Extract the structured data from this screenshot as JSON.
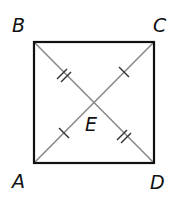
{
  "diagram": {
    "points": {
      "A": {
        "label": "A",
        "x": 34,
        "y": 163
      },
      "B": {
        "label": "B",
        "x": 34,
        "y": 42
      },
      "C": {
        "label": "C",
        "x": 154,
        "y": 42
      },
      "D": {
        "label": "D",
        "x": 154,
        "y": 163
      },
      "E": {
        "label": "E",
        "x": 94,
        "y": 102.5
      }
    },
    "labels": {
      "A": "A",
      "B": "B",
      "C": "C",
      "D": "D",
      "E": "E"
    },
    "segments": {
      "square": [
        "AB",
        "BC",
        "CD",
        "DA"
      ],
      "diagonals": [
        "AC",
        "BD"
      ]
    },
    "tick_marks": {
      "BE": 2,
      "ED": 2,
      "AE": 1,
      "EC": 1
    },
    "colors": {
      "square_stroke": "#111111",
      "diagonal_stroke": "#8a8a8a",
      "tick_stroke": "#333333",
      "label_color": "#111111"
    }
  }
}
